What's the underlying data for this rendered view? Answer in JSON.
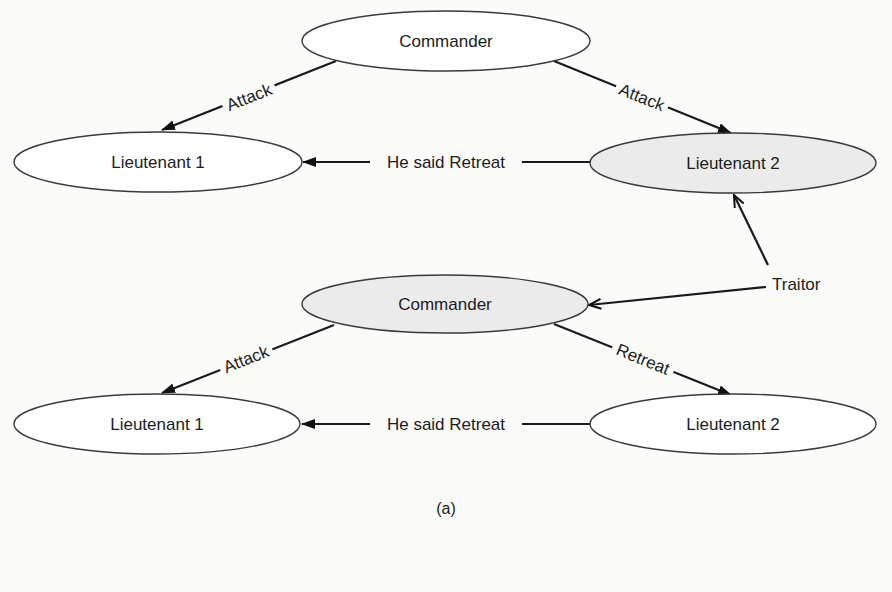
{
  "diagram": {
    "type": "byzantine-generals",
    "caption": "(a)",
    "colors": {
      "background": "#fbfbfa",
      "node_fill_plain": "#ffffff",
      "node_fill_traitor": "#ebebeb",
      "stroke": "#1a1a1a"
    },
    "scenario_top": {
      "nodes": {
        "commander": {
          "label": "Commander",
          "traitor": false
        },
        "lieutenant1": {
          "label": "Lieutenant 1",
          "traitor": false
        },
        "lieutenant2": {
          "label": "Lieutenant 2",
          "traitor": true
        }
      },
      "edges": {
        "cmd_to_l1": {
          "from": "Commander",
          "to": "Lieutenant 1",
          "label": "Attack"
        },
        "cmd_to_l2": {
          "from": "Commander",
          "to": "Lieutenant 2",
          "label": "Attack"
        },
        "l2_to_l1": {
          "from": "Lieutenant 2",
          "to": "Lieutenant 1",
          "label": "He said Retreat"
        }
      }
    },
    "scenario_bottom": {
      "nodes": {
        "commander": {
          "label": "Commander",
          "traitor": true
        },
        "lieutenant1": {
          "label": "Lieutenant 1",
          "traitor": false
        },
        "lieutenant2": {
          "label": "Lieutenant 2",
          "traitor": false
        }
      },
      "edges": {
        "cmd_to_l1": {
          "from": "Commander",
          "to": "Lieutenant 1",
          "label": "Attack"
        },
        "cmd_to_l2": {
          "from": "Commander",
          "to": "Lieutenant 2",
          "label": "Retreat"
        },
        "l2_to_l1": {
          "from": "Lieutenant 2",
          "to": "Lieutenant 1",
          "label": "He said Retreat"
        }
      }
    },
    "annotation": {
      "label": "Traitor",
      "points_to": [
        "Lieutenant 2 (top)",
        "Commander (bottom)"
      ]
    }
  }
}
